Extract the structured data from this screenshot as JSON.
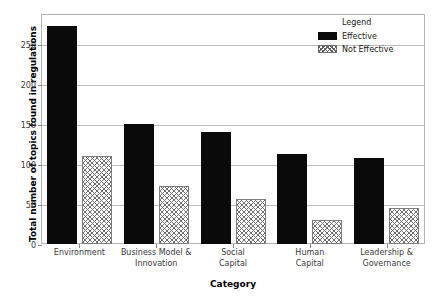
{
  "chart_data": {
    "type": "bar",
    "title": "",
    "xlabel": "Category",
    "ylabel": "Total number of topics found in regulations",
    "categories": [
      "Environment",
      "Business Model &\nInnovation",
      "Social\nCapital",
      "Human\nCapital",
      "Leadership &\nGovernance"
    ],
    "series": [
      {
        "name": "Effective",
        "values": [
          272,
          150,
          140,
          112,
          107
        ]
      },
      {
        "name": "Not Effective",
        "values": [
          110,
          73,
          56,
          30,
          45
        ]
      }
    ],
    "ylim": [
      0,
      287.5
    ],
    "yticks": [
      0,
      50,
      100,
      150,
      200,
      250
    ],
    "ytick_labels": [
      "0",
      "50",
      "100",
      "150",
      "200",
      "250"
    ],
    "grid": true,
    "legend": {
      "title": "Legend",
      "position": "upper right",
      "entries": [
        {
          "label": "Effective",
          "style": "solid-black",
          "color": "#0a0a0a"
        },
        {
          "label": "Not Effective",
          "style": "cross-hatch",
          "color": "#707070"
        }
      ]
    }
  },
  "axis": {
    "ylabel": "Total number of topics found in regulations",
    "xlabel": "Category",
    "ytick_labels": [
      "0",
      "50",
      "100",
      "150",
      "200",
      "250"
    ],
    "xtick_labels": [
      {
        "line1": "Environment",
        "line2": ""
      },
      {
        "line1": "Business Model &",
        "line2": "Innovation"
      },
      {
        "line1": "Social",
        "line2": "Capital"
      },
      {
        "line1": "Human",
        "line2": "Capital"
      },
      {
        "line1": "Leadership &",
        "line2": "Governance"
      }
    ]
  },
  "legend": {
    "title": "Legend",
    "effective_label": "Effective",
    "not_effective_label": "Not Effective"
  },
  "colors": {
    "effective": "#0a0a0a",
    "not_effective_hatch": "#707070",
    "frame": "#b3b3b3",
    "grid": "#bcbcbc",
    "background": "#ffffff"
  }
}
